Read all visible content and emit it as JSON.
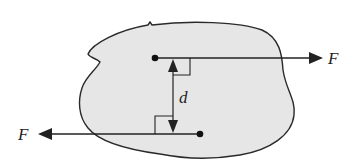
{
  "diagram": {
    "colors": {
      "body_fill": "#e6e6e6",
      "stroke": "#2a2a2a",
      "background": "#ffffff"
    },
    "forces": [
      {
        "label": "F",
        "direction": "right",
        "point": [
          155,
          58
        ],
        "tip": [
          322,
          58
        ],
        "label_pos": [
          328,
          64
        ]
      },
      {
        "label": "F",
        "direction": "left",
        "point": [
          200,
          134
        ],
        "tip": [
          38,
          134
        ],
        "label_pos": [
          18,
          140
        ]
      }
    ],
    "distance": {
      "label": "d",
      "x": 173,
      "y1": 58,
      "y2": 134,
      "label_pos": [
        179,
        103
      ]
    }
  }
}
